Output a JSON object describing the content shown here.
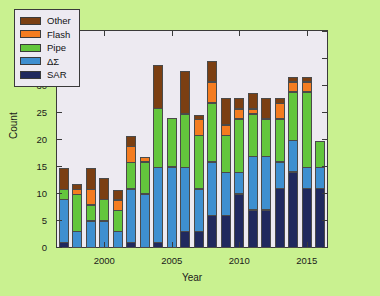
{
  "chart_data": {
    "type": "bar",
    "subtype": "stacked-bar",
    "title": "",
    "xlabel": "Year",
    "ylabel": "Count",
    "xlim": [
      1996.5,
      2016.5
    ],
    "ylim": [
      0,
      40
    ],
    "ytick_labels": [
      "0",
      "5",
      "10",
      "15",
      "20",
      "25",
      "30",
      "35",
      "40"
    ],
    "ytick_values": [
      0,
      5,
      10,
      15,
      20,
      25,
      30,
      35,
      40
    ],
    "xtick_labels": [
      "2000",
      "2005",
      "2010",
      "2015"
    ],
    "xtick_values": [
      2000,
      2005,
      2010,
      2015
    ],
    "grid": false,
    "legend_position": "upper-left",
    "stack_order_bottom_to_top": [
      "SAR",
      "DS",
      "Pipe",
      "Flash",
      "Other"
    ],
    "categories": [
      "1997",
      "1998",
      "1999",
      "2000",
      "2001",
      "2002",
      "2003",
      "2004",
      "2005",
      "2006",
      "2007",
      "2008",
      "2009",
      "2010",
      "2011",
      "2012",
      "2013",
      "2014",
      "2015",
      "2016"
    ],
    "series": [
      {
        "name": "SAR",
        "color": "#20295e",
        "values": [
          1,
          0,
          0,
          0,
          0,
          1,
          0,
          1,
          0,
          3,
          3,
          6,
          6,
          10,
          7,
          7,
          11,
          14,
          11,
          11
        ]
      },
      {
        "name": "DS",
        "color": "#3e8fd0",
        "values": [
          8,
          3,
          5,
          5,
          3,
          10,
          10,
          14,
          15,
          12,
          8,
          10,
          8,
          4,
          10,
          10,
          5,
          6,
          4,
          4
        ]
      },
      {
        "name": "Pipe",
        "color": "#63c63c",
        "values": [
          2,
          7,
          3,
          4,
          4,
          5,
          6,
          11,
          9,
          10,
          10,
          11,
          7,
          10,
          8,
          7,
          8,
          9,
          14,
          5
        ]
      },
      {
        "name": "Flash",
        "color": "#f47c20",
        "values": [
          0,
          1,
          3,
          0,
          2,
          3,
          1,
          0,
          0,
          0,
          3,
          4,
          2,
          2,
          1,
          0,
          3,
          2,
          2,
          0
        ]
      },
      {
        "name": "Other",
        "color": "#7b3f12",
        "values": [
          4,
          1,
          4,
          4,
          2,
          2,
          0,
          8,
          0,
          8,
          1,
          4,
          5,
          2,
          3,
          4,
          1,
          1,
          1,
          0
        ]
      }
    ],
    "totals": [
      15,
      12,
      15,
      13,
      11,
      21,
      17,
      34,
      24,
      33,
      25,
      35,
      28,
      28,
      29,
      28,
      28,
      32,
      32,
      20
    ]
  },
  "legend": {
    "entries": [
      {
        "label": "Other",
        "color": "#7b3f12"
      },
      {
        "label": "Flash",
        "color": "#f47c20"
      },
      {
        "label": "Pipe",
        "color": "#63c63c"
      },
      {
        "label": "ΔΣ",
        "color": "#3e8fd0"
      },
      {
        "label": "SAR",
        "color": "#20295e"
      }
    ]
  },
  "axes": {
    "y_title": "Count",
    "x_title": "Year"
  },
  "colors": {
    "figure_background": "#c9f190",
    "plot_background": "#edeaf1",
    "axis_line": "#3a3a3a",
    "text": "#1a1a1a"
  }
}
